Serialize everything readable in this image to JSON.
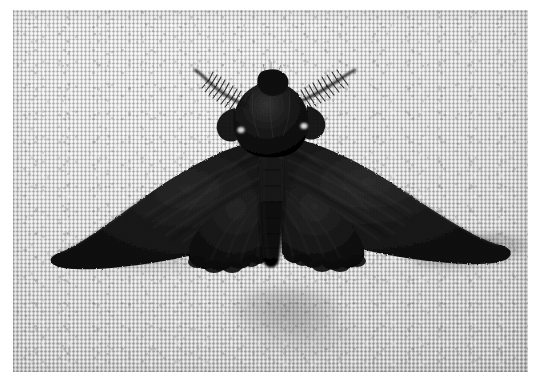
{
  "image": {
    "kind": "photograph",
    "subject": "dark melanic moth with spread wings resting on woven fabric",
    "orientation": "landscape",
    "width_px": 544,
    "height_px": 382,
    "border": "white photographic print margin"
  },
  "background": {
    "name": "woven-fabric",
    "description": "light gray woven canvas / linen cloth with fine orthogonal thread grid",
    "highlight_color": "#e2e2e2",
    "midtone_color": "#cfcfcf",
    "shadow_color": "#b4b4b4",
    "thread_dark": "#8a8a8a",
    "thread_light": "#f2f2f2"
  },
  "subject": {
    "name": "moth",
    "common_name": "peppered moth (melanic form)",
    "posture": "wings fully spread, dorsal view, head upward",
    "body_color": "#0b0b0b",
    "wing_color": "#121212",
    "wing_highlight": "#2e2e2e",
    "parts": {
      "left_forewing": "left-forewing",
      "right_forewing": "right-forewing",
      "left_hindwing": "left-hindwing",
      "right_hindwing": "right-hindwing",
      "thorax": "thorax",
      "abdomen": "abdomen",
      "head": "head",
      "left_antenna": "left-antenna",
      "right_antenna": "right-antenna",
      "eye_spot_left": "left-shoulder-spot",
      "eye_spot_right": "right-shoulder-spot"
    },
    "antenna_type": "bipectinate (feathery, comb-like)",
    "wingspan_px": 457,
    "shadow_color": "#6a6a6a"
  },
  "lighting": {
    "direction": "upper-left",
    "cast_shadow": "soft shadow below right wingtip and beneath abdomen"
  },
  "caption": ""
}
